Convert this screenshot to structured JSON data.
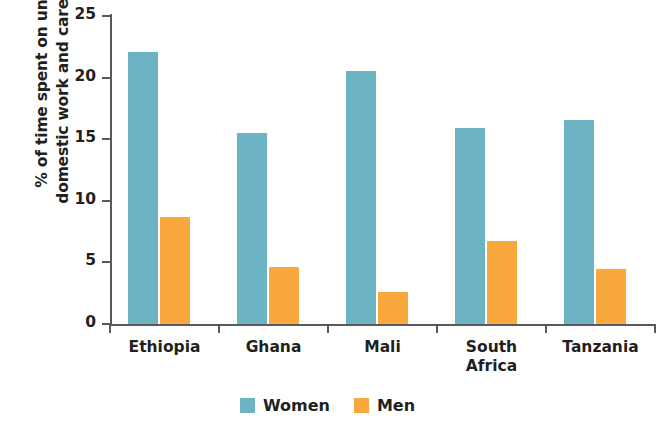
{
  "chart_data": {
    "type": "bar",
    "title": "",
    "xlabel": "",
    "ylabel": "% of time spent on unpaid\ndomestic work and caregiving",
    "categories": [
      "Ethiopia",
      "Ghana",
      "Mali",
      "South\nAfrica",
      "Tanzania"
    ],
    "series": [
      {
        "name": "Women",
        "color": "#6cb3c4",
        "values": [
          22.1,
          15.5,
          20.5,
          15.9,
          16.6
        ]
      },
      {
        "name": "Men",
        "color": "#f9a83e",
        "values": [
          8.7,
          4.6,
          2.6,
          6.7,
          4.5
        ]
      }
    ],
    "ylim": [
      0,
      25
    ],
    "yticks": [
      0,
      5,
      10,
      15,
      20,
      25
    ],
    "ytick_labels": [
      "0",
      "5",
      "10",
      "15",
      "20",
      "25"
    ],
    "grid": false,
    "legend_position": "bottom"
  },
  "legend": {
    "items": [
      {
        "label": "Women",
        "color": "#6cb3c4"
      },
      {
        "label": "Men",
        "color": "#f9a83e"
      }
    ]
  },
  "colors": {
    "women": "#6cb3c4",
    "men": "#f9a83e",
    "axis": "#58595b",
    "text": "#231f20",
    "background": "#ffffff"
  }
}
